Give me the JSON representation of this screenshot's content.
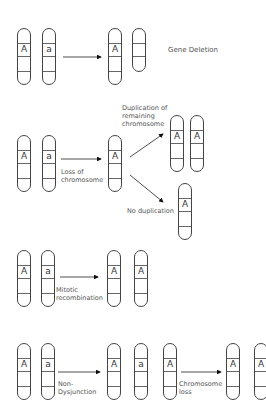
{
  "diagram": {
    "rows": [
      {
        "name": "gene-deletion",
        "label": "Gene Deletion",
        "before": [
          "A",
          "a"
        ],
        "after": [
          "A",
          ""
        ]
      },
      {
        "name": "loss-of-chromosome",
        "step_label": "Loss of chromosome",
        "step_label_lines": [
          "Loss of",
          "chromosome"
        ],
        "before": [
          "A",
          "a"
        ],
        "intermediate": [
          "A"
        ],
        "branches": [
          {
            "label_lines": [
              "Duplication of",
              "remaining",
              "chromosome"
            ],
            "label": "Duplication of remaining chromosome",
            "result": [
              "A",
              "A"
            ]
          },
          {
            "label": "No duplication",
            "result": [
              "A"
            ]
          }
        ]
      },
      {
        "name": "mitotic-recombination",
        "step_label_lines": [
          "Mitotic",
          "recombination"
        ],
        "step_label": "Mitotic recombination",
        "before": [
          "A",
          "a"
        ],
        "after": [
          "A",
          "A"
        ]
      },
      {
        "name": "non-disjunction",
        "step_label_lines": [
          "Non-",
          "Dysjunction"
        ],
        "step_label": "Non-Dysjunction",
        "before": [
          "A",
          "a"
        ],
        "intermediate": [
          "A",
          "a",
          "A"
        ],
        "step2_label_lines": [
          "Chromosome",
          "loss"
        ],
        "step2_label": "Chromosome loss",
        "after": [
          "A",
          "A"
        ]
      }
    ]
  }
}
